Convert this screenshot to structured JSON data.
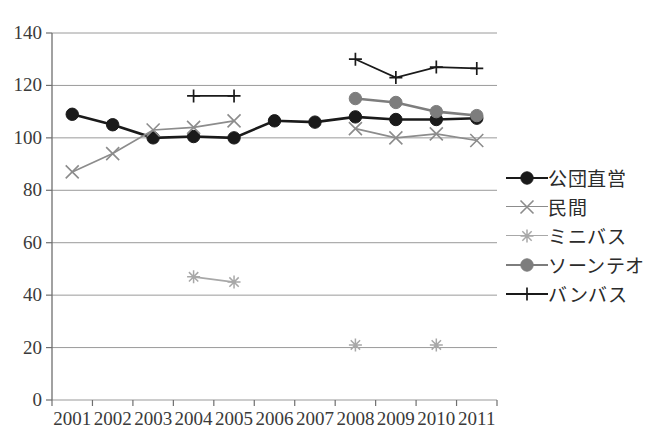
{
  "chart_data": {
    "type": "line",
    "title": "",
    "subtitle": "",
    "xlabel": "",
    "ylabel": "",
    "categories": [
      "2001",
      "2002",
      "2003",
      "2004",
      "2005",
      "2006",
      "2007",
      "2008",
      "2009",
      "2010",
      "2011"
    ],
    "ylim": [
      0,
      140
    ],
    "ytick_step": 20,
    "yticks": [
      "0",
      "20",
      "40",
      "60",
      "80",
      "100",
      "120",
      "140"
    ],
    "grid": "horizontal",
    "legend_position": "right",
    "series": [
      {
        "name": "公団直営",
        "color": "#1a1a1a",
        "marker": "circle-filled",
        "values": [
          109,
          105,
          100,
          100.5,
          100,
          106.5,
          106,
          108,
          107,
          107,
          107.5
        ]
      },
      {
        "name": "民間",
        "color": "#8c8c8c",
        "marker": "x",
        "values": [
          87,
          94,
          103,
          104,
          106.5,
          null,
          null,
          103.5,
          100,
          101.5,
          99
        ]
      },
      {
        "name": "ミニバス",
        "color": "#a8a8a8",
        "marker": "asterisk",
        "values": [
          null,
          null,
          null,
          47,
          45,
          null,
          null,
          21,
          null,
          21,
          null
        ]
      },
      {
        "name": "ソーンテオ",
        "color": "#7d7d7d",
        "marker": "circle-filled",
        "values": [
          null,
          null,
          null,
          null,
          null,
          null,
          null,
          115,
          113.5,
          110,
          108.5
        ]
      },
      {
        "name": "バンバス",
        "color": "#1a1a1a",
        "marker": "plus",
        "values": [
          null,
          null,
          null,
          116,
          116,
          null,
          null,
          130,
          123,
          127,
          126.5
        ]
      }
    ]
  },
  "legend": {
    "items": [
      {
        "label": "公団直営",
        "marker": "circle-filled-dark",
        "color": "#1a1a1a"
      },
      {
        "label": "民間",
        "marker": "x-gray",
        "color": "#8c8c8c"
      },
      {
        "label": "ミニバス",
        "marker": "asterisk-gray",
        "color": "#a8a8a8"
      },
      {
        "label": "ソーンテオ",
        "marker": "circle-filled-gray",
        "color": "#7d7d7d"
      },
      {
        "label": "バンバス",
        "marker": "plus-dark",
        "color": "#1a1a1a"
      }
    ]
  },
  "axes": {
    "x_tick_labels": [
      "2001",
      "2002",
      "2003",
      "2004",
      "2005",
      "2006",
      "2007",
      "2008",
      "2009",
      "2010",
      "2011"
    ],
    "y_tick_labels": [
      "140",
      "120",
      "100",
      "80",
      "60",
      "40",
      "20",
      "0"
    ]
  }
}
